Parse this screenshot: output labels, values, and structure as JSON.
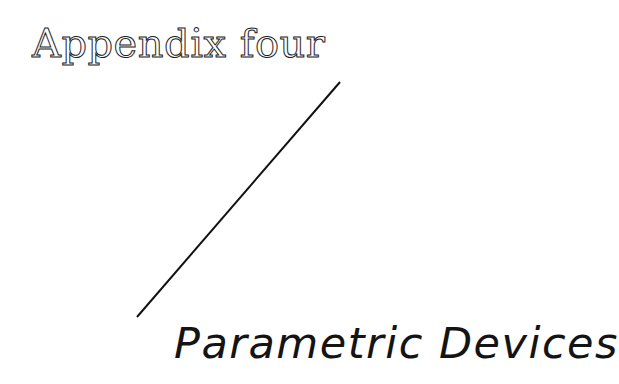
{
  "page": {
    "appendix_label": "Appendix four",
    "title": "Parametric Devices"
  }
}
